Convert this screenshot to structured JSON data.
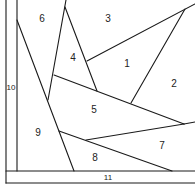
{
  "diagram": {
    "regions": [
      {
        "id": "1",
        "label": "1",
        "x": 127,
        "y": 64
      },
      {
        "id": "2",
        "label": "2",
        "x": 174,
        "y": 84
      },
      {
        "id": "3",
        "label": "3",
        "x": 108,
        "y": 19
      },
      {
        "id": "4",
        "label": "4",
        "x": 73,
        "y": 58
      },
      {
        "id": "5",
        "label": "5",
        "x": 94,
        "y": 110
      },
      {
        "id": "6",
        "label": "6",
        "x": 42,
        "y": 19
      },
      {
        "id": "7",
        "label": "7",
        "x": 162,
        "y": 146
      },
      {
        "id": "8",
        "label": "8",
        "x": 95,
        "y": 158
      },
      {
        "id": "9",
        "label": "9",
        "x": 38,
        "y": 133
      },
      {
        "id": "10",
        "label": "10",
        "x": 11,
        "y": 88
      },
      {
        "id": "11",
        "label": "11",
        "x": 108,
        "y": 178
      }
    ],
    "stroke_color": "#1a1a1a",
    "background": "#ffffff"
  }
}
